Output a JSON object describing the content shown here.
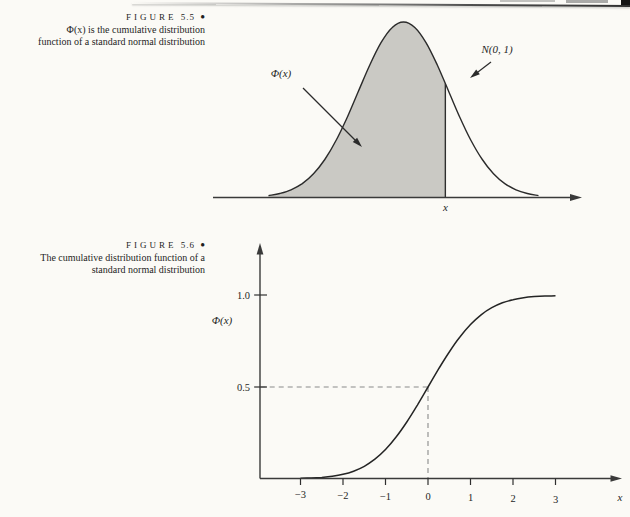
{
  "page": {
    "type": "scanned textbook page"
  },
  "colors": {
    "paper": "#fbfaf6",
    "ink": "#1f1f1f",
    "curve": "#2b2b2b",
    "axis": "#3a3a3a",
    "shade": "#cac9c4",
    "dashed_guide": "#8a8a8a"
  },
  "figure55": {
    "caption": {
      "label": "FIGURE",
      "number": "5.5",
      "bullet": "●",
      "lines": [
        "Φ(x) is the cumulative distribution",
        "function of a standard normal distribution"
      ]
    },
    "annotations": {
      "phi": "Φ(x)",
      "normal": "N(0, 1)",
      "x": "x"
    }
  },
  "figure56": {
    "caption": {
      "label": "FIGURE",
      "number": "5.6",
      "bullet": "●",
      "lines": [
        "The cumulative distribution function of a",
        "standard normal distribution"
      ]
    },
    "axis": {
      "ylabel": "Φ(x)",
      "xlabel": "x",
      "ytick_labels": [
        "1.0",
        "0.5"
      ],
      "xtick_labels": [
        "−3",
        "−2",
        "−1",
        "0",
        "1",
        "2",
        "3"
      ]
    }
  },
  "chart_data": [
    {
      "figure": "5.5",
      "type": "area",
      "title": "Standard normal density N(0,1) with Φ(x) shown as the shaded area up to the point x",
      "curve": "standard normal probability density",
      "x": [
        -3,
        -2.75,
        -2.5,
        -2.25,
        -2,
        -1.75,
        -1.5,
        -1.25,
        -1,
        -0.75,
        -0.5,
        -0.25,
        0,
        0.25,
        0.5,
        0.75,
        1,
        1.25,
        1.5,
        1.75,
        2,
        2.25,
        2.5,
        2.75,
        3
      ],
      "pdf": [
        0.0044,
        0.0091,
        0.0175,
        0.0317,
        0.054,
        0.0863,
        0.1295,
        0.1826,
        0.242,
        0.3011,
        0.3521,
        0.3867,
        0.3989,
        0.3867,
        0.3521,
        0.3011,
        0.242,
        0.1826,
        0.1295,
        0.0863,
        0.054,
        0.0317,
        0.0175,
        0.0091,
        0.0044
      ],
      "shade_to_x": 0.93,
      "pdf_at_boundary": 0.2589,
      "shaded_region": "area under the density from -infinity to x",
      "annotations": [
        "Φ(x)",
        "N(0, 1)",
        "x"
      ],
      "grid": false
    },
    {
      "figure": "5.6",
      "type": "line",
      "title": "The cumulative distribution function of a standard normal distribution",
      "xlabel": "x",
      "ylabel": "Φ(x)",
      "x": [
        -3,
        -2.75,
        -2.5,
        -2.25,
        -2,
        -1.75,
        -1.5,
        -1.25,
        -1,
        -0.75,
        -0.5,
        -0.25,
        0,
        0.25,
        0.5,
        0.75,
        1,
        1.25,
        1.5,
        1.75,
        2,
        2.25,
        2.5,
        2.75,
        3
      ],
      "cdf": [
        0.0013,
        0.003,
        0.0062,
        0.0122,
        0.0228,
        0.0401,
        0.0668,
        0.1056,
        0.1587,
        0.2266,
        0.3085,
        0.4013,
        0.5,
        0.5987,
        0.6915,
        0.7734,
        0.8413,
        0.8944,
        0.9332,
        0.9599,
        0.9772,
        0.9878,
        0.9938,
        0.997,
        0.9987
      ],
      "xticks": [
        -3,
        -2,
        -1,
        0,
        1,
        2,
        3
      ],
      "yticks": [
        0.5,
        1.0
      ],
      "xlim": [
        -3,
        3
      ],
      "ylim": [
        0,
        1.0
      ],
      "guide": {
        "x": 0,
        "y": 0.5,
        "style": "dashed"
      },
      "grid": false,
      "legend": "none"
    }
  ]
}
